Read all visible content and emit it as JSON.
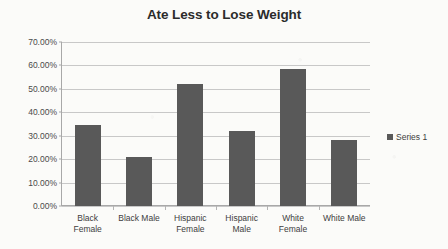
{
  "chart_data": {
    "type": "bar",
    "title": "Ate Less to Lose Weight",
    "xlabel": "",
    "ylabel": "",
    "categories": [
      "Black Female",
      "Black Male",
      "Hispanic Female",
      "Hispanic Male",
      "White Female",
      "White Male"
    ],
    "category_lines": [
      [
        "Black",
        "Female"
      ],
      [
        "Black Male"
      ],
      [
        "Hispanic",
        "Female"
      ],
      [
        "Hispanic",
        "Male"
      ],
      [
        "White",
        "Female"
      ],
      [
        "White Male"
      ]
    ],
    "values": [
      34.6,
      21.0,
      51.9,
      32.2,
      58.4,
      28.2
    ],
    "ylim": [
      0,
      70
    ],
    "ytick_values": [
      70,
      60,
      50,
      40,
      30,
      20,
      10,
      0
    ],
    "ytick_labels": [
      "70.00%",
      "60.00%",
      "50.00%",
      "40.00%",
      "30.00%",
      "20.00%",
      "10.00%",
      "0.00%"
    ],
    "grid": true,
    "legend_position": "right",
    "series": [
      {
        "name": "Series 1",
        "color": "#595959",
        "values": [
          34.6,
          21.0,
          51.9,
          32.2,
          58.4,
          28.2
        ]
      }
    ]
  },
  "legend": {
    "entries": [
      {
        "label": "Series 1",
        "color": "#595959"
      }
    ]
  },
  "colors": {
    "bar": "#595959",
    "gridline": "#c8c8c8",
    "axis": "#a8a8a8",
    "title_text": "#2b2b2b",
    "label_text": "#3d3d3d",
    "background": "#fbfbf9"
  }
}
